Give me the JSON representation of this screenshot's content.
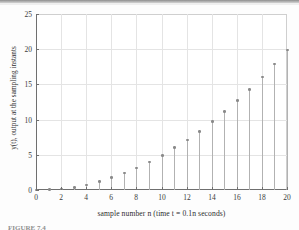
{
  "figure": {
    "caption_partial": "FIGURE 7.4",
    "background_color": "#ffffff",
    "axis_color": "#6f6f6f",
    "grid_color": "#e4e4e4",
    "stem_color": "#b2b2b2",
    "marker_color": "#8a8a8a"
  },
  "chart_data": {
    "type": "scatter",
    "plot_style": "stem",
    "title": "",
    "subtitle": "",
    "xlabel": "sample number n (time t = 0.1n seconds)",
    "ylabel": "y(t), output at the sampling instants",
    "xlim": [
      0,
      20
    ],
    "ylim": [
      0,
      25
    ],
    "xticks": [
      0,
      2,
      4,
      6,
      8,
      10,
      12,
      14,
      16,
      18,
      20
    ],
    "yticks": [
      0,
      5,
      10,
      15,
      20,
      25
    ],
    "xticklabels": [
      "0",
      "2",
      "4",
      "6",
      "8",
      "10",
      "12",
      "14",
      "16",
      "18",
      "20"
    ],
    "yticklabels": [
      "0",
      "5",
      "10",
      "15",
      "20",
      "25"
    ],
    "grid": true,
    "legend": null,
    "annotations": [],
    "x": [
      0,
      1,
      2,
      3,
      4,
      5,
      6,
      7,
      8,
      9,
      10,
      11,
      12,
      13,
      14,
      15,
      16,
      17,
      18,
      19,
      20
    ],
    "values": [
      0,
      0.05,
      0.15,
      0.35,
      0.7,
      1.2,
      1.75,
      2.4,
      3.1,
      4.0,
      4.9,
      6.0,
      7.1,
      8.35,
      9.75,
      11.15,
      12.7,
      14.3,
      16.05,
      17.9,
      19.9
    ]
  }
}
